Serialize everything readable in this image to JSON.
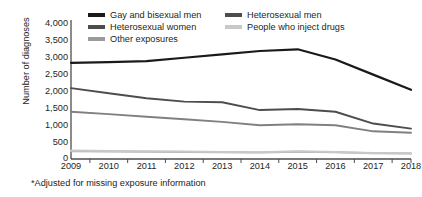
{
  "chart_data": {
    "type": "line",
    "title": "",
    "xlabel": "",
    "ylabel": "Number of diagnoses",
    "x": [
      2009,
      2010,
      2011,
      2012,
      2013,
      2014,
      2015,
      2016,
      2017,
      2018
    ],
    "categories": [
      "2009",
      "2010",
      "2011",
      "2012",
      "2013",
      "2014",
      "2015",
      "2016",
      "2017",
      "2018"
    ],
    "ylim": [
      0,
      4000
    ],
    "yticks": [
      0,
      500,
      1000,
      1500,
      2000,
      2500,
      3000,
      3500,
      4000
    ],
    "ytick_labels": [
      "0",
      "500",
      "1,000",
      "1,500",
      "2,000",
      "2,500",
      "3,000",
      "3,500",
      "4,000"
    ],
    "grid": false,
    "legend_position": "top",
    "series": [
      {
        "name": "Gay and bisexual men",
        "color": "#1a1a1a",
        "values": [
          2850,
          2870,
          2900,
          3000,
          3100,
          3200,
          3250,
          2950,
          2500,
          2050
        ]
      },
      {
        "name": "Heterosexual men",
        "color": "#4d4d4d",
        "values": [
          2100,
          1950,
          1800,
          1700,
          1680,
          1450,
          1480,
          1400,
          1050,
          900
        ]
      },
      {
        "name": "Heterosexual women",
        "color": "#808080",
        "values": [
          1400,
          1330,
          1250,
          1180,
          1100,
          1000,
          1030,
          1000,
          820,
          780
        ]
      },
      {
        "name": "People who inject drugs",
        "color": "#c8c8c8",
        "values": [
          250,
          240,
          230,
          220,
          210,
          200,
          230,
          210,
          180,
          170
        ]
      },
      {
        "name": "Other exposures",
        "color": "#b3b3b3",
        "values": [
          230,
          220,
          215,
          205,
          200,
          195,
          215,
          200,
          170,
          160
        ]
      }
    ],
    "footnote": "*Adjusted for missing exposure information"
  },
  "legend": {
    "items": [
      {
        "label": "Gay and bisexual men",
        "color": "#1a1a1a"
      },
      {
        "label": "Heterosexual women",
        "color": "#4d4d4d"
      },
      {
        "label": "Other exposures",
        "color": "#9a9a9a"
      },
      {
        "label": "Heterosexual men",
        "color": "#4d4d4d"
      },
      {
        "label": "People who inject drugs",
        "color": "#c8c8c8"
      }
    ]
  },
  "axis": {
    "color": "#4d4d4d"
  }
}
